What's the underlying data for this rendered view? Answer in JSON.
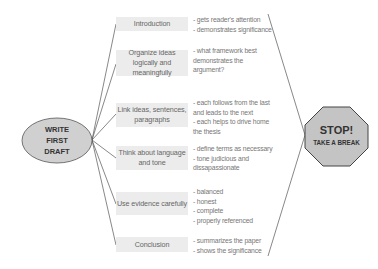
{
  "diagram": {
    "start_node": {
      "label_lines": [
        "WRITE",
        "FIRST",
        "DRAFT"
      ],
      "fill": "#d0d0d0",
      "stroke": "#555555"
    },
    "steps": [
      {
        "label": "Introduction",
        "notes": "- gets reader's attention\n- demonstrates significance"
      },
      {
        "label": "Organize ideas logically and meaningfully",
        "notes": "- what framework best\n  demonstrates the\n  argument?"
      },
      {
        "label": "Link ideas, sentences, paragraphs",
        "notes": "- each follows from the last\n  and leads to the next\n- each helps to drive home\n  the thesis"
      },
      {
        "label": "Think about language and tone",
        "notes": "- define terms as necessary\n- tone judicious and\n  dissapassionate"
      },
      {
        "label": "Use evidence carefully",
        "notes": "- balanced\n- honest\n- complete\n- properly referenced"
      },
      {
        "label": "Conclusion",
        "notes": "- summarizes the paper\n- shows the significance"
      }
    ],
    "end_node": {
      "title": "STOP!",
      "subtitle": "TAKE A BREAK",
      "shape": "octagon",
      "fill": "#c4c4c4",
      "stroke": "#444444"
    },
    "colors": {
      "box_fill": "#ececec",
      "line": "#444444",
      "text": "#666666"
    }
  }
}
